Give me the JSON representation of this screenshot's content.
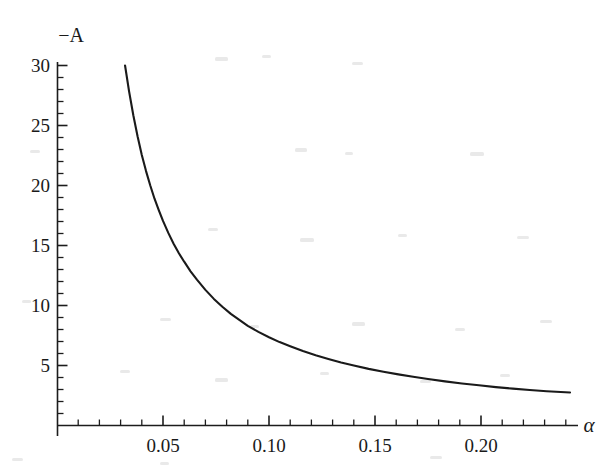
{
  "chart_data": {
    "type": "line",
    "title": "",
    "subtitle": "",
    "xlabel": "α",
    "ylabel": "−A",
    "xlim": [
      0.0,
      0.2475
    ],
    "ylim": [
      0.0,
      31.5
    ],
    "grid": false,
    "legend": null,
    "x_ticks_major": [
      0.05,
      0.1,
      0.15,
      0.2
    ],
    "x_tick_labels": [
      "0.05",
      "0.10",
      "0.15",
      "0.20"
    ],
    "x_ticks_minor": [
      0.01,
      0.02,
      0.03,
      0.04,
      0.06,
      0.07,
      0.08,
      0.09,
      0.11,
      0.12,
      0.13,
      0.14,
      0.16,
      0.17,
      0.18,
      0.19,
      0.21,
      0.22,
      0.23,
      0.24
    ],
    "y_ticks_major": [
      5,
      10,
      15,
      20,
      25,
      30
    ],
    "y_tick_labels": [
      "5",
      "10",
      "15",
      "20",
      "25",
      "30"
    ],
    "y_ticks_minor": [
      1,
      2,
      3,
      4,
      6,
      7,
      8,
      9,
      11,
      12,
      13,
      14,
      16,
      17,
      18,
      19,
      21,
      22,
      23,
      24,
      26,
      27,
      28,
      29
    ],
    "line_color": "#1a1a1a",
    "background_color": "#ffffff",
    "series": [
      {
        "name": "-A(alpha)",
        "x": [
          0.0321,
          0.034,
          0.036,
          0.038,
          0.04,
          0.042,
          0.044,
          0.046,
          0.048,
          0.05,
          0.0525,
          0.055,
          0.0575,
          0.06,
          0.063,
          0.066,
          0.07,
          0.074,
          0.078,
          0.082,
          0.086,
          0.09,
          0.095,
          0.1,
          0.105,
          0.11,
          0.116,
          0.122,
          0.128,
          0.134,
          0.14,
          0.147,
          0.154,
          0.161,
          0.168,
          0.175,
          0.183,
          0.191,
          0.199,
          0.207,
          0.215,
          0.223,
          0.231,
          0.242
        ],
        "y": [
          30.0,
          27.85,
          25.85,
          24.1,
          22.55,
          21.2,
          20.0,
          18.9,
          17.95,
          17.05,
          16.05,
          15.15,
          14.35,
          13.65,
          12.85,
          12.15,
          11.3,
          10.55,
          9.9,
          9.3,
          8.8,
          8.3,
          7.8,
          7.35,
          6.95,
          6.6,
          6.2,
          5.85,
          5.55,
          5.25,
          5.0,
          4.72,
          4.48,
          4.26,
          4.06,
          3.88,
          3.68,
          3.5,
          3.35,
          3.2,
          3.07,
          2.96,
          2.86,
          2.75
        ]
      }
    ]
  },
  "axes": {
    "y_axis_title": "−A",
    "x_axis_title": "α"
  },
  "page": {
    "width": 613,
    "height": 475
  }
}
